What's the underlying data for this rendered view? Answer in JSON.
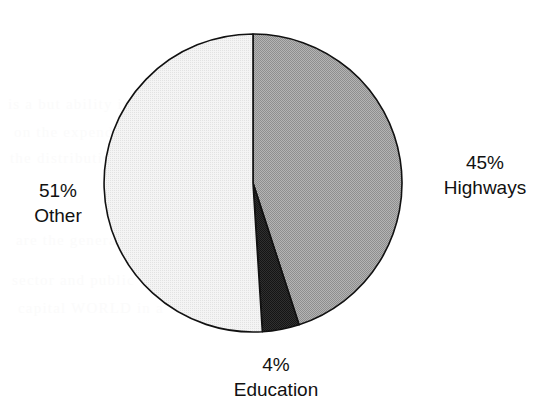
{
  "chart_data": {
    "type": "pie",
    "title": "",
    "subtitle": "",
    "xlabel": "",
    "ylabel": "",
    "legend_position": "none",
    "grid": false,
    "labels_inline": true,
    "start_angle_deg": 90,
    "direction": "clockwise",
    "categories": [
      "Highways",
      "Education",
      "Other"
    ],
    "values": [
      45,
      4,
      51
    ],
    "value_unit": "%",
    "slices": [
      {
        "name": "Highways",
        "value": 45,
        "percent_text": "45%",
        "label_text": "Highways",
        "color": "#a3a3a3",
        "start_deg": 0,
        "end_deg": 162,
        "label_position": "right"
      },
      {
        "name": "Education",
        "value": 4,
        "percent_text": "4%",
        "label_text": "Education",
        "color": "#2c2c2c",
        "start_deg": 162,
        "end_deg": 176.4,
        "label_position": "bottom"
      },
      {
        "name": "Other",
        "value": 51,
        "percent_text": "51%",
        "label_text": "Other",
        "color": "#ededed",
        "start_deg": 176.4,
        "end_deg": 360,
        "label_position": "left"
      }
    ],
    "stroke_color": "#111111",
    "background_color": "#ffffff"
  },
  "figure": {
    "background_color": "#ffffff",
    "outline_color": "#111111"
  },
  "labels": {
    "highways": {
      "percent": "45%",
      "category": "Highways"
    },
    "other": {
      "percent": "51%",
      "category": "Other"
    },
    "education": {
      "percent": "4%",
      "category": "Education"
    }
  },
  "ghost_text": {
    "lines": [
      "is a but ability in",
      "on  the expenditure  also ",
      "the  distribution of  revenue",
      "are  the general  fund  to the",
      "sector and public  works  that",
      "capital  WORLD  in  a"
    ]
  }
}
